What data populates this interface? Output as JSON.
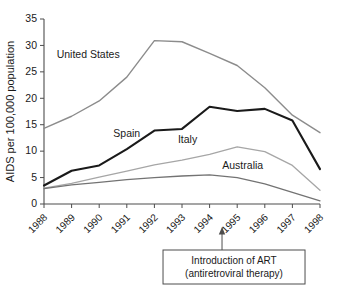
{
  "chart_data": {
    "type": "line",
    "title": "",
    "xlabel": "",
    "ylabel": "AIDS per 100,000 population",
    "categories": [
      "1988",
      "1989",
      "1990",
      "1991",
      "1992",
      "1993",
      "1994",
      "1995",
      "1996",
      "1997",
      "1998"
    ],
    "x": [
      1988,
      1989,
      1990,
      1991,
      1992,
      1993,
      1994,
      1995,
      1996,
      1997,
      1998
    ],
    "xlim": [
      1988,
      1998
    ],
    "ylim": [
      0,
      35
    ],
    "yticks": [
      0,
      5,
      10,
      15,
      20,
      25,
      30,
      35
    ],
    "ytick_labels": [
      "0",
      "5",
      "10",
      "15",
      "20",
      "25",
      "30",
      "35"
    ],
    "grid": false,
    "legend_position": "inline-labels",
    "series": [
      {
        "name": "United States",
        "color": "#8c8c8c",
        "width": 1.4,
        "label_x": 1989.6,
        "label_y": 27.6,
        "values": [
          14.3,
          16.6,
          19.5,
          24.0,
          30.9,
          30.7,
          28.5,
          26.2,
          22.0,
          16.8,
          13.5
        ]
      },
      {
        "name": "Spain",
        "color": "#1a1a1a",
        "width": 2.1,
        "label_x": 1991.0,
        "label_y": 12.6,
        "values": [
          3.5,
          6.3,
          7.3,
          10.4,
          13.9,
          14.2,
          18.4,
          17.6,
          18.0,
          15.8,
          6.6
        ]
      },
      {
        "name": "Italy",
        "color": "#a6a6a6",
        "width": 1.3,
        "label_x": 1993.2,
        "label_y": 11.6,
        "values": [
          3.0,
          3.9,
          5.1,
          6.2,
          7.4,
          8.3,
          9.4,
          10.8,
          9.9,
          7.3,
          2.6
        ]
      },
      {
        "name": "Australia",
        "color": "#737373",
        "width": 1.3,
        "label_x": 1995.2,
        "label_y": 6.7,
        "values": [
          2.9,
          3.6,
          4.1,
          4.6,
          5.0,
          5.3,
          5.5,
          5.0,
          3.8,
          2.2,
          0.6
        ]
      }
    ],
    "annotations": [
      {
        "line1": "Introduction of ART",
        "line2": "(antiretroviral therapy)",
        "pointer_x": 1994.45
      }
    ]
  }
}
